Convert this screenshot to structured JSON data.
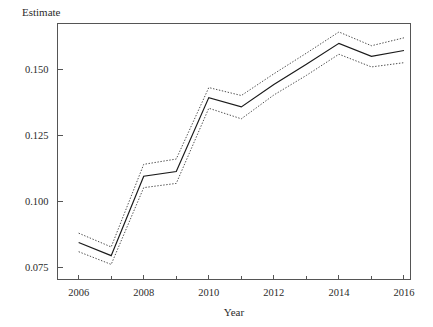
{
  "chart_data": {
    "type": "line",
    "title": "",
    "xlabel": "Year",
    "ylabel": "Estimate",
    "x": [
      2006,
      2007,
      2008,
      2009,
      2010,
      2011,
      2012,
      2013,
      2014,
      2015,
      2016
    ],
    "series": [
      {
        "name": "Estimate",
        "style": "solid",
        "values": [
          0.0845,
          0.0795,
          0.1095,
          0.1113,
          0.1392,
          0.1357,
          0.1442,
          0.1518,
          0.1597,
          0.1548,
          0.157
        ]
      },
      {
        "name": "Upper confidence bound",
        "style": "dotted",
        "values": [
          0.088,
          0.0828,
          0.114,
          0.116,
          0.143,
          0.14,
          0.1482,
          0.156,
          0.164,
          0.1588,
          0.1618
        ]
      },
      {
        "name": "Lower confidence bound",
        "style": "dotted",
        "values": [
          0.081,
          0.0762,
          0.1052,
          0.1068,
          0.1352,
          0.1312,
          0.1402,
          0.1476,
          0.1556,
          0.1508,
          0.1524
        ]
      }
    ],
    "xlim": [
      2005.35,
      2016.2
    ],
    "ylim": [
      0.0705,
      0.1672
    ],
    "xticks_major": [
      2006,
      2008,
      2010,
      2012,
      2014,
      2016
    ],
    "xticks_minor": [
      2007,
      2009,
      2011,
      2013,
      2015
    ],
    "xtick_labels": [
      "2006",
      "2008",
      "2010",
      "2012",
      "2014",
      "2016"
    ],
    "yticks": [
      0.075,
      0.1,
      0.125,
      0.15
    ],
    "ytick_labels": [
      "0.075",
      "0.100",
      "0.125",
      "0.150"
    ],
    "grid": false,
    "legend": "none",
    "colors": {
      "line": "#1a1a1a",
      "confidence": "#3a3a3a",
      "axis": "#555555",
      "text": "#2b2b2b",
      "background": "#ffffff"
    }
  },
  "labels": {
    "y_axis_title": "Estimate",
    "x_axis_title": "Year"
  }
}
